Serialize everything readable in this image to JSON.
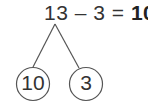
{
  "equation": {
    "minuend": "13",
    "minus": "–",
    "subtrahend": "3",
    "equals": "=",
    "result": "10"
  },
  "bond": {
    "left": "10",
    "right": "3"
  },
  "colors": {
    "text": "#333333",
    "stroke": "#555555"
  }
}
